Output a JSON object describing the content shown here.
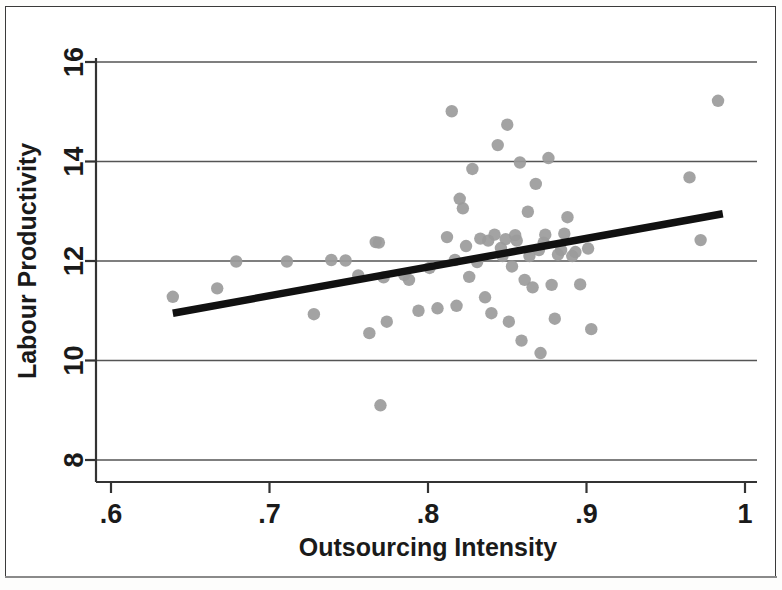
{
  "chart_data": {
    "type": "scatter",
    "title": "",
    "xlabel": "Outsourcing Intensity",
    "ylabel": "Labour Productivity",
    "xlim": [
      0.6,
      1.0
    ],
    "ylim": [
      8,
      16
    ],
    "xticks": [
      0.6,
      0.7,
      0.8,
      0.9,
      1.0
    ],
    "xtick_labels": [
      ".6",
      ".7",
      ".8",
      ".9",
      "1"
    ],
    "yticks": [
      8,
      10,
      12,
      14,
      16
    ],
    "ytick_labels": [
      "8",
      "10",
      "12",
      "14",
      "16"
    ],
    "grid": "horizontal",
    "legend": "none",
    "point_color": "#9b9b9b",
    "line_color": "#111111",
    "grid_color": "#555555",
    "axis_color": "#333333",
    "fit_line": {
      "label": "linear fit",
      "x": [
        0.639,
        0.986
      ],
      "y": [
        10.95,
        12.95
      ],
      "slope": 5.76,
      "intercept": 7.27
    },
    "points": [
      [
        0.639,
        11.28
      ],
      [
        0.667,
        11.45
      ],
      [
        0.679,
        11.99
      ],
      [
        0.711,
        11.99
      ],
      [
        0.728,
        10.93
      ],
      [
        0.739,
        12.02
      ],
      [
        0.748,
        12.01
      ],
      [
        0.756,
        11.71
      ],
      [
        0.763,
        10.55
      ],
      [
        0.767,
        12.38
      ],
      [
        0.769,
        12.37
      ],
      [
        0.77,
        9.1
      ],
      [
        0.772,
        11.67
      ],
      [
        0.774,
        10.78
      ],
      [
        0.785,
        11.72
      ],
      [
        0.788,
        11.62
      ],
      [
        0.794,
        11.0
      ],
      [
        0.801,
        11.86
      ],
      [
        0.806,
        11.05
      ],
      [
        0.812,
        12.48
      ],
      [
        0.815,
        15.01
      ],
      [
        0.817,
        12.02
      ],
      [
        0.818,
        11.1
      ],
      [
        0.82,
        13.25
      ],
      [
        0.822,
        13.06
      ],
      [
        0.824,
        12.3
      ],
      [
        0.826,
        11.68
      ],
      [
        0.828,
        13.85
      ],
      [
        0.831,
        11.98
      ],
      [
        0.833,
        12.45
      ],
      [
        0.836,
        11.27
      ],
      [
        0.838,
        12.41
      ],
      [
        0.84,
        10.95
      ],
      [
        0.842,
        12.53
      ],
      [
        0.844,
        14.33
      ],
      [
        0.846,
        12.26
      ],
      [
        0.847,
        12.1
      ],
      [
        0.849,
        12.44
      ],
      [
        0.85,
        14.74
      ],
      [
        0.851,
        10.78
      ],
      [
        0.853,
        11.89
      ],
      [
        0.855,
        12.52
      ],
      [
        0.856,
        12.41
      ],
      [
        0.858,
        13.98
      ],
      [
        0.859,
        10.4
      ],
      [
        0.861,
        11.62
      ],
      [
        0.863,
        12.99
      ],
      [
        0.864,
        12.1
      ],
      [
        0.866,
        11.47
      ],
      [
        0.868,
        13.55
      ],
      [
        0.87,
        12.22
      ],
      [
        0.871,
        10.15
      ],
      [
        0.873,
        12.37
      ],
      [
        0.874,
        12.53
      ],
      [
        0.876,
        14.07
      ],
      [
        0.878,
        11.52
      ],
      [
        0.88,
        10.84
      ],
      [
        0.882,
        12.13
      ],
      [
        0.884,
        12.22
      ],
      [
        0.886,
        12.55
      ],
      [
        0.888,
        12.88
      ],
      [
        0.891,
        12.1
      ],
      [
        0.893,
        12.18
      ],
      [
        0.896,
        11.53
      ],
      [
        0.901,
        12.25
      ],
      [
        0.903,
        10.63
      ],
      [
        0.965,
        13.68
      ],
      [
        0.972,
        12.42
      ],
      [
        0.983,
        15.22
      ]
    ]
  },
  "axis": {
    "x_title": "Outsourcing Intensity",
    "y_title": "Labour Productivity"
  }
}
